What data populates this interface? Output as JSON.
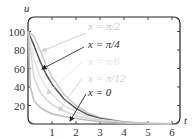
{
  "chart_data": {
    "type": "line",
    "title": "",
    "xlabel": "t",
    "ylabel": "u",
    "xlim": [
      0,
      6
    ],
    "ylim": [
      0,
      110
    ],
    "grid": false,
    "x_ticks": [
      1,
      2,
      3,
      4,
      5,
      6
    ],
    "y_ticks": [
      20,
      40,
      60,
      80,
      100
    ],
    "legend": "annotations with arrows",
    "series": [
      {
        "name": "x = π/2",
        "color": "#c8c8c8",
        "x": [
          0,
          0.25,
          0.5,
          0.75,
          1,
          1.5,
          2,
          2.5,
          3,
          4,
          5,
          6
        ],
        "values": [
          100,
          95,
          80,
          64,
          51,
          32,
          20,
          12,
          7,
          2.5,
          0.8,
          0.3
        ]
      },
      {
        "name": "x = π/4",
        "color": "#555555",
        "x": [
          0,
          0.25,
          0.5,
          0.75,
          1,
          1.5,
          2,
          2.5,
          3,
          4,
          5,
          6
        ],
        "values": [
          100,
          85,
          68,
          54,
          43,
          27,
          17,
          10,
          6,
          2,
          0.7,
          0.2
        ]
      },
      {
        "name": "x = π/6",
        "color": "#e2e2e2",
        "x": [
          0,
          0.25,
          0.5,
          0.75,
          1,
          1.5,
          2,
          2.5,
          3,
          4,
          5,
          6
        ],
        "values": [
          100,
          70,
          52,
          40,
          32,
          20,
          13,
          8,
          5,
          1.8,
          0.6,
          0.2
        ]
      },
      {
        "name": "x = π/12",
        "color": "#d6d6d6",
        "x": [
          0,
          0.25,
          0.5,
          0.75,
          1,
          1.5,
          2,
          2.5,
          3,
          4,
          5,
          6
        ],
        "values": [
          100,
          50,
          35,
          27,
          21,
          14,
          9,
          6,
          4,
          1.4,
          0.5,
          0.2
        ]
      },
      {
        "name": "x = 0",
        "color": "#bdbdbd",
        "x": [
          0,
          0.1,
          0.25,
          0.5,
          0.75,
          1,
          1.5,
          2,
          2.5,
          3,
          4,
          5,
          6
        ],
        "values": [
          100,
          40,
          25,
          18,
          14,
          11,
          8,
          6,
          4,
          2.5,
          1,
          0.4,
          0.1
        ]
      }
    ],
    "annotations": [
      {
        "text": "x =  π/2",
        "color": "#c8c8c8",
        "label_pos": [
          88,
          30
        ],
        "arrow_from": [
          86,
          33
        ],
        "arrow_to": [
          42,
          51
        ]
      },
      {
        "text": "x =  π/4",
        "color": "#333333",
        "label_pos": [
          88,
          48
        ],
        "arrow_from": [
          84,
          47
        ],
        "arrow_to": [
          42,
          69
        ]
      },
      {
        "text": "x =  π/6",
        "color": "#e4e4e4",
        "label_pos": [
          88,
          65
        ],
        "arrow_from": [
          82,
          62
        ],
        "arrow_to": [
          47,
          94
        ]
      },
      {
        "text": "x =  π/12",
        "color": "#cfcfcf",
        "label_pos": [
          88,
          82
        ],
        "arrow_from": [
          82,
          78
        ],
        "arrow_to": [
          59,
          111
        ]
      },
      {
        "text": "x = 0",
        "color": "#222222",
        "label_pos": [
          88,
          96
        ],
        "arrow_from": [
          86,
          94
        ],
        "arrow_to": [
          70,
          121
        ]
      }
    ]
  }
}
